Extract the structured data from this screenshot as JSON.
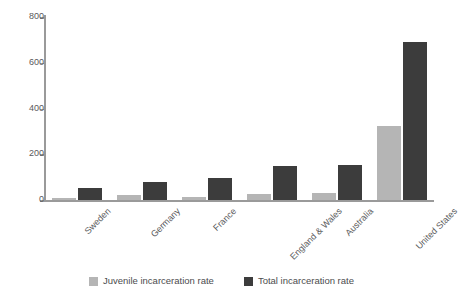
{
  "chart_data": {
    "type": "bar",
    "title": "",
    "subtitle": "",
    "xlabel": "",
    "ylabel": "",
    "ylim": [
      0,
      800
    ],
    "yticks": [
      0,
      200,
      400,
      600,
      800
    ],
    "grid": false,
    "legend_position": "bottom",
    "categories": [
      "Sweden",
      "Germany",
      "France",
      "England & Wales",
      "Australia",
      "United States"
    ],
    "series": [
      {
        "name": "Juvenile incarceration rate",
        "color": "#b5b5b5",
        "values": [
          8,
          20,
          15,
          26,
          32,
          325
        ]
      },
      {
        "name": "Total incarceration rate",
        "color": "#3c3c3c",
        "values": [
          52,
          78,
          98,
          148,
          152,
          690
        ]
      }
    ]
  },
  "axis": {
    "tick_labels": [
      "800",
      "600",
      "400",
      "200",
      "0"
    ],
    "axis_color": "#9a9a9a",
    "tick_text_color": "#59595b"
  },
  "legend": {
    "items": [
      {
        "label": "Juvenile incarceration rate",
        "swatch": "legend-swatch-juvenile"
      },
      {
        "label": "Total incarceration rate",
        "swatch": "legend-swatch-total"
      }
    ]
  }
}
